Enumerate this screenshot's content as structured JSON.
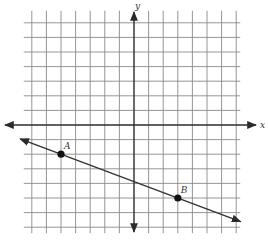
{
  "diagram": {
    "type": "coordinate-plane",
    "grid": {
      "x_range": [
        -7,
        7
      ],
      "y_range": [
        -7,
        7
      ]
    },
    "axes": {
      "x_label": "x",
      "y_label": "y"
    },
    "line": {
      "through": [
        "A",
        "B"
      ],
      "arrows": "both"
    },
    "points": [
      {
        "name": "A",
        "label": "A",
        "x": -5,
        "y": -2
      },
      {
        "name": "B",
        "label": "B",
        "x": 3,
        "y": -5
      }
    ],
    "colors": {
      "grid": "#8a8a8a",
      "axis": "#2b2b2b",
      "line": "#333333",
      "point": "#111111"
    }
  }
}
